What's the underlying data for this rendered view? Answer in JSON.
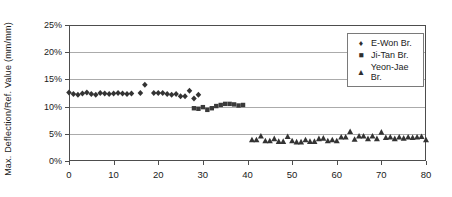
{
  "chart_data": {
    "type": "scatter",
    "ylabel": "Max. Deflection/Ref. Value (mm/mm)",
    "xlim": [
      0,
      80
    ],
    "ylim_percent": [
      0,
      25
    ],
    "x_ticks": [
      0,
      10,
      20,
      30,
      40,
      50,
      60,
      70,
      80
    ],
    "x_tick_labels": [
      "0",
      "10",
      "20",
      "30",
      "40",
      "50",
      "60",
      "70",
      "80"
    ],
    "y_ticks_percent": [
      0,
      5,
      10,
      15,
      20,
      25
    ],
    "y_tick_labels": [
      "0%",
      "5%",
      "10%",
      "15%",
      "20%",
      "25%"
    ],
    "grid": "horizontal",
    "legend_position": "inside-top-right",
    "series": [
      {
        "name": "E-Won Br.",
        "marker": "diamond",
        "color": "#333333",
        "points": [
          [
            0,
            12.6
          ],
          [
            1,
            12.3
          ],
          [
            2,
            12.2
          ],
          [
            3,
            12.4
          ],
          [
            4,
            12.6
          ],
          [
            5,
            12.3
          ],
          [
            6,
            12.2
          ],
          [
            7,
            12.5
          ],
          [
            8,
            12.4
          ],
          [
            9,
            12.3
          ],
          [
            10,
            12.4
          ],
          [
            11,
            12.5
          ],
          [
            12,
            12.4
          ],
          [
            13,
            12.3
          ],
          [
            14,
            12.4
          ],
          [
            16,
            12.5
          ],
          [
            17,
            14.0
          ],
          [
            19,
            12.5
          ],
          [
            20,
            12.5
          ],
          [
            21,
            12.5
          ],
          [
            22,
            12.3
          ],
          [
            23,
            12.2
          ],
          [
            24,
            12.3
          ],
          [
            25,
            11.9
          ],
          [
            26,
            11.9
          ],
          [
            27,
            12.9
          ],
          [
            28,
            11.5
          ],
          [
            29,
            12.2
          ]
        ]
      },
      {
        "name": "Ji-Tan Br.",
        "marker": "square",
        "color": "#3a3a3a",
        "points": [
          [
            28,
            9.7
          ],
          [
            29,
            9.6
          ],
          [
            30,
            9.9
          ],
          [
            31,
            9.4
          ],
          [
            32,
            9.7
          ],
          [
            33,
            10.1
          ],
          [
            34,
            10.3
          ],
          [
            35,
            10.5
          ],
          [
            36,
            10.5
          ],
          [
            37,
            10.4
          ],
          [
            38,
            10.2
          ],
          [
            39,
            10.3
          ]
        ]
      },
      {
        "name": "Yeon-Jae Br.",
        "marker": "triangle",
        "color": "#333333",
        "points": [
          [
            41,
            3.9
          ],
          [
            42,
            3.9
          ],
          [
            43,
            4.6
          ],
          [
            44,
            3.7
          ],
          [
            45,
            3.7
          ],
          [
            46,
            4.1
          ],
          [
            47,
            3.6
          ],
          [
            48,
            3.6
          ],
          [
            49,
            4.5
          ],
          [
            50,
            3.7
          ],
          [
            51,
            3.5
          ],
          [
            52,
            3.5
          ],
          [
            53,
            3.9
          ],
          [
            54,
            3.6
          ],
          [
            55,
            3.6
          ],
          [
            56,
            4.1
          ],
          [
            57,
            4.2
          ],
          [
            58,
            3.7
          ],
          [
            59,
            3.9
          ],
          [
            60,
            3.7
          ],
          [
            61,
            4.4
          ],
          [
            62,
            4.4
          ],
          [
            63,
            5.4
          ],
          [
            64,
            4.0
          ],
          [
            65,
            4.6
          ],
          [
            66,
            4.6
          ],
          [
            67,
            4.1
          ],
          [
            68,
            4.6
          ],
          [
            69,
            4.1
          ],
          [
            70,
            5.3
          ],
          [
            71,
            4.3
          ],
          [
            72,
            4.4
          ],
          [
            73,
            4.1
          ],
          [
            74,
            4.4
          ],
          [
            75,
            4.2
          ],
          [
            76,
            4.4
          ],
          [
            77,
            4.3
          ],
          [
            78,
            4.4
          ],
          [
            79,
            4.5
          ],
          [
            80,
            3.9
          ]
        ]
      }
    ]
  },
  "legend": {
    "marker_glyphs": {
      "diamond": "♦",
      "square": "■",
      "triangle": "▲"
    }
  },
  "colors": {
    "background": "#ffffff",
    "plot_border": "#4d4d4d",
    "gridline": "#ababab",
    "tick": "#4d4d4d",
    "text": "#1a1a1a",
    "marker": "#333333"
  }
}
